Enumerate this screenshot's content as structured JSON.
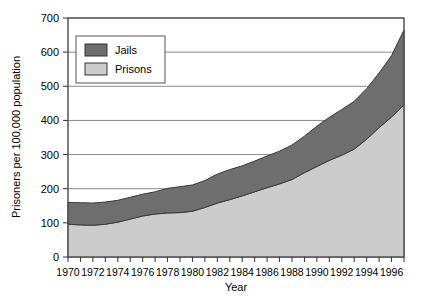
{
  "chart_data": {
    "type": "area",
    "stacked": true,
    "title": "",
    "xlabel": "Year",
    "ylabel": "Prisoners per 100,000 population",
    "xlim": [
      1970,
      1997
    ],
    "ylim": [
      0,
      700
    ],
    "ytick_values": [
      0,
      100,
      200,
      300,
      400,
      500,
      600,
      700
    ],
    "ytick_labels": [
      "0",
      "100",
      "200",
      "300",
      "400",
      "500",
      "600",
      "700"
    ],
    "xtick_labels": [
      "1970",
      "1972",
      "1974",
      "1976",
      "1978",
      "1980",
      "1982",
      "1984",
      "1986",
      "1988",
      "1990",
      "1992",
      "1994",
      "1996"
    ],
    "xtick_values": [
      1970,
      1972,
      1974,
      1976,
      1978,
      1980,
      1982,
      1984,
      1986,
      1988,
      1990,
      1992,
      1994,
      1996
    ],
    "minor_xticks": [
      1971,
      1973,
      1975,
      1977,
      1979,
      1981,
      1983,
      1985,
      1987,
      1989,
      1991,
      1993,
      1995,
      1997
    ],
    "grid": "horizontal",
    "legend_position": "upper-left-inside",
    "x": [
      1970,
      1971,
      1972,
      1973,
      1974,
      1975,
      1976,
      1977,
      1978,
      1979,
      1980,
      1981,
      1982,
      1983,
      1984,
      1985,
      1986,
      1987,
      1988,
      1989,
      1990,
      1991,
      1992,
      1993,
      1994,
      1995,
      1996,
      1997
    ],
    "series": [
      {
        "name": "Prisons",
        "color": "#cccccc",
        "values": [
          96,
          94,
          93,
          96,
          102,
          111,
          120,
          126,
          129,
          130,
          134,
          145,
          158,
          168,
          179,
          191,
          203,
          214,
          227,
          247,
          265,
          283,
          298,
          316,
          345,
          379,
          410,
          445
        ]
      },
      {
        "name": "Jails",
        "color": "#6e6e6e",
        "values": [
          64,
          65,
          65,
          65,
          64,
          64,
          64,
          65,
          72,
          76,
          77,
          79,
          85,
          88,
          88,
          90,
          93,
          96,
          101,
          107,
          118,
          126,
          134,
          140,
          148,
          160,
          180,
          220
        ]
      }
    ],
    "totals": [
      160,
      159,
      158,
      161,
      166,
      175,
      184,
      191,
      201,
      206,
      211,
      224,
      243,
      256,
      267,
      281,
      296,
      310,
      328,
      354,
      383,
      409,
      432,
      456,
      493,
      539,
      590,
      665
    ]
  },
  "legend": {
    "items": [
      {
        "label": "Jails",
        "color": "#6e6e6e"
      },
      {
        "label": "Prisons",
        "color": "#cccccc"
      }
    ]
  },
  "axes": {
    "y_title": "Prisoners per 100,000 population",
    "x_title": "Year"
  }
}
